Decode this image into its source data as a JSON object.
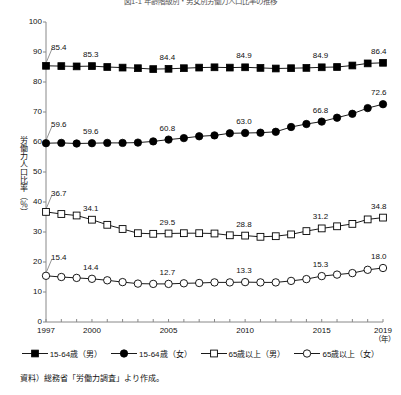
{
  "chart_data": {
    "type": "line",
    "title": "図1-1 年齢階級別・男女別労働力人口比率の推移",
    "xlabel": "（年）",
    "ylabel": "労働力人口比率（％）",
    "ylim": [
      0,
      100
    ],
    "ytick_step": 10,
    "yticks": [
      "0",
      "10",
      "20",
      "30",
      "40",
      "50",
      "60",
      "70",
      "80",
      "90",
      "100"
    ],
    "xlim": [
      1997,
      2019
    ],
    "x": [
      1997,
      1998,
      1999,
      2000,
      2001,
      2002,
      2003,
      2004,
      2005,
      2006,
      2007,
      2008,
      2009,
      2010,
      2011,
      2012,
      2013,
      2014,
      2015,
      2016,
      2017,
      2018,
      2019
    ],
    "xticks": [
      {
        "year": 1997,
        "label": "1997"
      },
      {
        "year": 2000,
        "label": "2000"
      },
      {
        "year": 2005,
        "label": "2005"
      },
      {
        "year": 2010,
        "label": "2010"
      },
      {
        "year": 2015,
        "label": "2015"
      },
      {
        "year": 2019,
        "label": "2019"
      }
    ],
    "grid": false,
    "legend_position": "bottom",
    "series": [
      {
        "name": "15-64歳（男）",
        "marker": "filled-square",
        "color": "#000000",
        "values": [
          85.4,
          85.3,
          85.2,
          85.3,
          85.0,
          84.8,
          84.6,
          84.3,
          84.4,
          84.6,
          84.8,
          84.9,
          84.8,
          84.9,
          84.7,
          84.5,
          84.6,
          84.7,
          84.9,
          85.0,
          85.5,
          86.2,
          86.4
        ],
        "labeled_points": [
          {
            "year": 1997,
            "value": 85.4,
            "text": "85.4"
          },
          {
            "year": 2000,
            "value": 85.3,
            "text": "85.3"
          },
          {
            "year": 2005,
            "value": 84.4,
            "text": "84.4"
          },
          {
            "year": 2010,
            "value": 84.9,
            "text": "84.9"
          },
          {
            "year": 2015,
            "value": 84.9,
            "text": "84.9"
          },
          {
            "year": 2019,
            "value": 86.4,
            "text": "86.4"
          }
        ]
      },
      {
        "name": "15-64歳（女）",
        "marker": "filled-circle",
        "color": "#000000",
        "values": [
          59.6,
          59.7,
          59.5,
          59.6,
          59.7,
          59.7,
          59.8,
          60.2,
          60.8,
          61.3,
          61.9,
          62.2,
          62.9,
          63.0,
          63.1,
          63.4,
          65.0,
          66.0,
          66.8,
          68.1,
          69.4,
          71.3,
          72.6
        ],
        "labeled_points": [
          {
            "year": 1997,
            "value": 59.6,
            "text": "59.6"
          },
          {
            "year": 2000,
            "value": 59.6,
            "text": "59.6"
          },
          {
            "year": 2005,
            "value": 60.8,
            "text": "60.8"
          },
          {
            "year": 2010,
            "value": 63.0,
            "text": "63.0"
          },
          {
            "year": 2015,
            "value": 66.8,
            "text": "66.8"
          },
          {
            "year": 2019,
            "value": 72.6,
            "text": "72.6"
          }
        ]
      },
      {
        "name": "65歳以上（男）",
        "marker": "open-square",
        "color": "#000000",
        "values": [
          36.7,
          36.0,
          35.5,
          34.1,
          32.4,
          31.0,
          29.6,
          29.4,
          29.5,
          29.6,
          29.6,
          29.5,
          28.9,
          28.8,
          28.4,
          28.6,
          29.2,
          30.3,
          31.2,
          31.9,
          32.7,
          34.2,
          34.8
        ],
        "labeled_points": [
          {
            "year": 1997,
            "value": 36.7,
            "text": "36.7"
          },
          {
            "year": 2000,
            "value": 34.1,
            "text": "34.1"
          },
          {
            "year": 2005,
            "value": 29.5,
            "text": "29.5"
          },
          {
            "year": 2010,
            "value": 28.8,
            "text": "28.8"
          },
          {
            "year": 2015,
            "value": 31.2,
            "text": "31.2"
          },
          {
            "year": 2019,
            "value": 34.8,
            "text": "34.8"
          }
        ]
      },
      {
        "name": "65歳以上（女）",
        "marker": "open-circle",
        "color": "#000000",
        "values": [
          15.4,
          15.0,
          14.7,
          14.4,
          13.9,
          13.3,
          12.8,
          12.7,
          12.7,
          12.9,
          13.0,
          13.2,
          13.2,
          13.3,
          13.2,
          13.2,
          13.7,
          14.3,
          15.3,
          15.8,
          16.3,
          17.4,
          18.0
        ],
        "labeled_points": [
          {
            "year": 1997,
            "value": 15.4,
            "text": "15.4"
          },
          {
            "year": 2000,
            "value": 14.4,
            "text": "14.4"
          },
          {
            "year": 2005,
            "value": 12.7,
            "text": "12.7"
          },
          {
            "year": 2010,
            "value": 13.3,
            "text": "13.3"
          },
          {
            "year": 2015,
            "value": 15.3,
            "text": "15.3"
          },
          {
            "year": 2019,
            "value": 18.0,
            "text": "18.0"
          }
        ]
      }
    ],
    "source_note": "資料）総務省「労働力調査」より作成。"
  }
}
